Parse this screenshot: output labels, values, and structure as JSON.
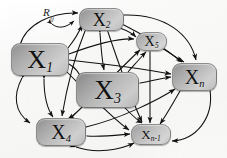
{
  "figure": {
    "type": "directed-graph-diagram",
    "background_color": "#fdfdfd",
    "edge_color": "#111111",
    "node_fill_light": "#cfcfcf",
    "node_fill_dark": "#8e8e8e"
  },
  "annotation": {
    "relation_symbol": "R",
    "relation_subscript": "ij"
  },
  "nodes": [
    {
      "id": "x1",
      "symbol": "X",
      "subscript": "1",
      "label": "X1"
    },
    {
      "id": "x2",
      "symbol": "X",
      "subscript": "2",
      "label": "X2"
    },
    {
      "id": "x3",
      "symbol": "X",
      "subscript": "3",
      "label": "X3"
    },
    {
      "id": "x4",
      "symbol": "X",
      "subscript": "4",
      "label": "X4"
    },
    {
      "id": "x5",
      "symbol": "X",
      "subscript": "5",
      "label": "X5"
    },
    {
      "id": "xn1",
      "symbol": "X",
      "subscript": "n-1",
      "label": "Xn-1"
    },
    {
      "id": "xn",
      "symbol": "X",
      "subscript": "n",
      "label": "Xn"
    }
  ]
}
